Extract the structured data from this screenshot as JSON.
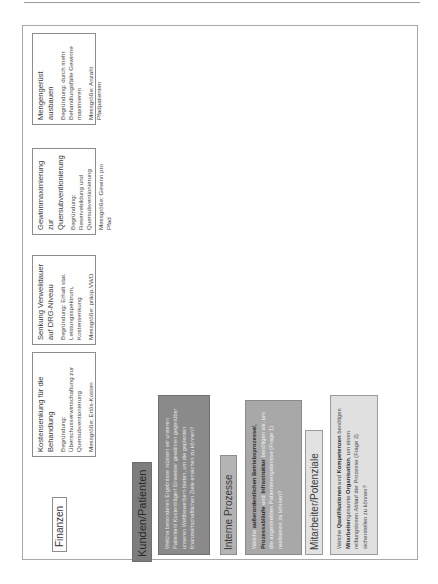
{
  "page": {
    "orientation": "rotated-90-ccw"
  },
  "finanzen": {
    "label": "Finanzen",
    "cards": [
      {
        "title": "Kostensenkung für die Behandlung",
        "begruendung": "Begründung: Überschusserwirtschaftung zur Quersubventionierung",
        "messgroesse": "Messgröße: Erlös-Kosten"
      },
      {
        "title": "Senkung Verweildauer auf DRG-Niveau",
        "begruendung": "Begründung: Erhalt stat. Leistungsspektrum, Kostensenkung",
        "messgroesse": "Messgröße: präop.VWD"
      },
      {
        "title": "Gewinnmaximierung zur Quersubventionierung",
        "begruendung": "Begründung: Reservebildung und Quersubventionierung",
        "messgroesse": "Messgröße: Gewinn pro Pfad"
      },
      {
        "title": "Mengengerüst ausbauen",
        "begruendung": "Begründung: durch mehr Behandlungsfälle Gewinne maximieren",
        "messgroesse": "Messgröße: Anzahl Pfadpatienten"
      }
    ]
  },
  "kunden": {
    "label": "Kunden/Patienten",
    "question": "Welche besonderen Ergebnisse müssen wir unseren Patienten/ Kostenträger/ Einweiser gewähren gegenüber unseren Wettbewerbern bieten, um die geplanten finanzwirtschaftlichen Ziele erreichen zu können?"
  },
  "interne": {
    "label": "Interne Prozesse",
    "q_pre": "Welche ",
    "q_bold1": "außerordentlichen Betriebsprozesse/, Prozessabläufe",
    "q_mid": " und ",
    "q_bold2": "Infrastruktur",
    "q_post": " benötigen wir, um die angestrebten Patientenergebnisse (Frage 1) realisieren zu können?"
  },
  "mitarbeiter": {
    "label": "Mitarbeiter/Potenziale",
    "q_pre": "Welche ",
    "q_bold1": "Qualifikationen",
    "q_mid1": " und ",
    "q_bold2": "Kompetenzen",
    "q_mid2": " benötigen ",
    "q_bold3": "Mitarbeiter",
    "q_mid3": "/gesamte ",
    "q_bold4": "Organisation",
    "q_post": ", um einen reibungslosen Ablauf der Prozesse (Frage 2) sicherstellen zu können?"
  }
}
